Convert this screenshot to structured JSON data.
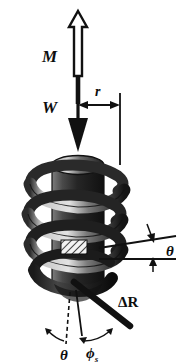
{
  "figure": {
    "background_color": "#ffffff",
    "ink_color": "#111111",
    "labels": {
      "moment": "M",
      "weight": "W",
      "radius": "r",
      "helix_angle_right": "θ",
      "helix_angle_bottom": "θ",
      "delta_r": "ΔR",
      "phi_s": "ϕ",
      "phi_s_subscript": "s"
    },
    "arrows": {
      "moment_arrow": "up-hollow-arrow",
      "weight_arrow": "down-solid-arrow",
      "radius_dimension": "double-headed-horizontal-arrow",
      "theta_upper_pointer": "down-left-arrow",
      "theta_lower_pointer": "up-arrow",
      "theta_arc_pointer": "curved-arc-arrow",
      "phi_arc_pointer": "curved-arc-arrow"
    },
    "geometry": {
      "shaft_axis_x": 78,
      "helix_turns": 4,
      "cylinder_top_y": 152,
      "cylinder_bottom_y": 290
    },
    "colors": {
      "helix_light": "#d0d0d0",
      "helix_mid": "#8c8c8c",
      "helix_dark": "#3a3a3a",
      "helix_black": "#161616",
      "outline": "#111111"
    }
  }
}
